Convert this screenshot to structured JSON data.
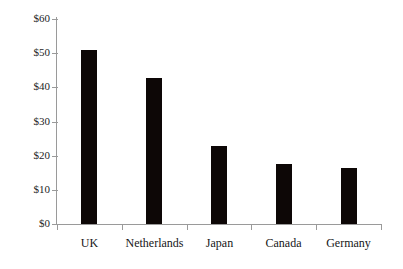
{
  "chart_data": {
    "type": "bar",
    "title": "",
    "subtitle": "",
    "xlabel": "",
    "ylabel": "",
    "categories": [
      "UK",
      "Netherlands",
      "Japan",
      "Canada",
      "Germany"
    ],
    "values": [
      51,
      42.8,
      22.8,
      17.6,
      16.4
    ],
    "value_prefix": "$",
    "ylim": [
      0,
      60
    ],
    "ytick_values": [
      0,
      10,
      20,
      30,
      40,
      50,
      60
    ],
    "ytick_labels": [
      "$0",
      "$10",
      "$20",
      "$30",
      "$40",
      "$50",
      "$60"
    ],
    "grid": false,
    "legend": false,
    "legend_position": "none",
    "series": [
      {
        "name": "",
        "values": [
          51,
          42.8,
          22.8,
          17.6,
          16.4
        ]
      }
    ],
    "colors": {
      "bar": "#0d0706",
      "axis": "#9a9a9a",
      "text": "#1a1a1a",
      "background": "#ffffff"
    }
  },
  "axis": {
    "y_labels": [
      "$60",
      "$50",
      "$40",
      "$30",
      "$20",
      "$10",
      "$0"
    ]
  },
  "bars": [
    {
      "label": "UK",
      "value": 51
    },
    {
      "label": "Netherlands",
      "value": 42.8
    },
    {
      "label": "Japan",
      "value": 22.8
    },
    {
      "label": "Canada",
      "value": 17.6
    },
    {
      "label": "Germany",
      "value": 16.4
    }
  ]
}
